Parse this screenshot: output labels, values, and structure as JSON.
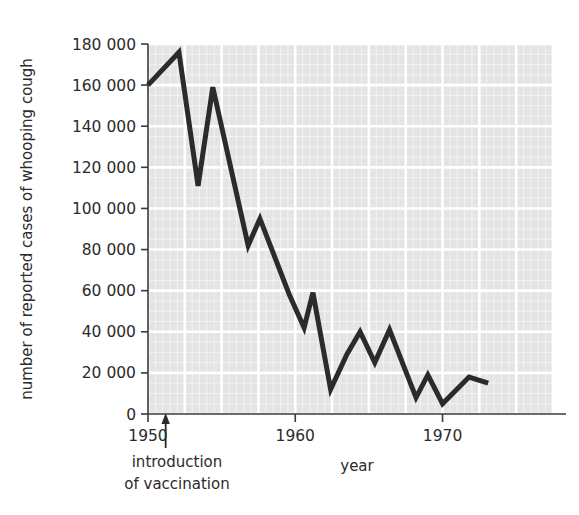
{
  "chart_data": {
    "type": "line",
    "title": "",
    "xlabel": "year",
    "ylabel": "number of reported cases of whooping cough",
    "xlim": [
      1950,
      1977.5
    ],
    "ylim": [
      0,
      180000
    ],
    "grid": true,
    "legend": null,
    "x_ticks": [
      1950,
      1960,
      1970
    ],
    "x_tick_labels": [
      "1950",
      "1960",
      "1970"
    ],
    "y_ticks": [
      0,
      20000,
      40000,
      60000,
      80000,
      100000,
      120000,
      140000,
      160000,
      180000
    ],
    "y_tick_labels": [
      "0",
      "20 000",
      "40 000",
      "60 000",
      "80 000",
      "100 000",
      "120 000",
      "140 000",
      "160 000",
      "180 000"
    ],
    "x": [
      1950,
      1951,
      1952,
      1953,
      1954,
      1955,
      1956,
      1957,
      1958,
      1959,
      1960,
      1961,
      1962,
      1963,
      1964,
      1965,
      1966,
      1967,
      1968,
      1969,
      1970,
      1971,
      1972,
      1973,
      1974,
      1975
    ],
    "values": [
      160000,
      176000,
      111000,
      159000,
      82000,
      95000,
      78000,
      68000,
      58000,
      42000,
      59000,
      12000,
      29000,
      40000,
      25000,
      41000,
      30000,
      8000,
      19000,
      5000,
      10000,
      18000,
      15000,
      13000,
      16000,
      15000
    ],
    "series": [
      {
        "name": "reported cases of whooping cough",
        "color": "#2b2b2b",
        "line_width": 5,
        "points": [
          {
            "x": 1950.0,
            "y": 160000
          },
          {
            "x": 1952.1,
            "y": 176000
          },
          {
            "x": 1953.4,
            "y": 111000
          },
          {
            "x": 1954.4,
            "y": 159000
          },
          {
            "x": 1956.8,
            "y": 82000
          },
          {
            "x": 1957.6,
            "y": 95000
          },
          {
            "x": 1959.6,
            "y": 58000
          },
          {
            "x": 1960.6,
            "y": 42000
          },
          {
            "x": 1961.2,
            "y": 59000
          },
          {
            "x": 1962.4,
            "y": 12000
          },
          {
            "x": 1963.5,
            "y": 29000
          },
          {
            "x": 1964.4,
            "y": 40000
          },
          {
            "x": 1965.4,
            "y": 25000
          },
          {
            "x": 1966.4,
            "y": 41000
          },
          {
            "x": 1968.2,
            "y": 8000
          },
          {
            "x": 1969.0,
            "y": 19000
          },
          {
            "x": 1970.0,
            "y": 5000
          },
          {
            "x": 1971.8,
            "y": 18000
          },
          {
            "x": 1973.1,
            "y": 15000
          }
        ]
      }
    ],
    "annotations": [
      {
        "name": "introduction-of-vaccination",
        "text_line1": "introduction",
        "text_line2": "of vaccination",
        "x": 1951.2,
        "arrow": true
      }
    ],
    "style": {
      "plot_background": "#e4e4e4",
      "gridline_color": "#ffffff",
      "axis_color": "#3a3a3a",
      "text_color": "#2b2b2b",
      "page_background": "#ffffff"
    }
  },
  "axis": {
    "y_label": "number of reported cases of whooping cough",
    "x_label": "year"
  },
  "annotation": {
    "line1": "introduction",
    "line2": "of vaccination"
  }
}
